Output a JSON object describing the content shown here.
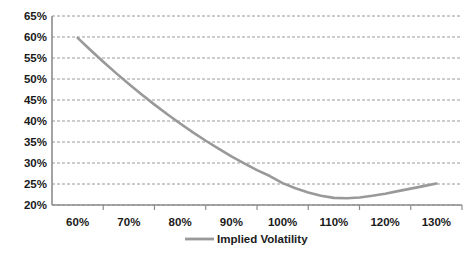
{
  "chart_data": {
    "type": "line",
    "title": "",
    "xlabel": "",
    "ylabel": "",
    "xlim": [
      55,
      135
    ],
    "ylim": [
      20,
      65
    ],
    "grid": true,
    "grid_style": "dashed-horizontal",
    "legend_position": "bottom",
    "x_tick_labels": [
      "60%",
      "70%",
      "80%",
      "90%",
      "100%",
      "110%",
      "120%",
      "130%"
    ],
    "x_tick_values": [
      60,
      70,
      80,
      90,
      100,
      110,
      120,
      130
    ],
    "y_tick_labels": [
      "20%",
      "25%",
      "30%",
      "35%",
      "40%",
      "45%",
      "50%",
      "55%",
      "60%",
      "65%"
    ],
    "y_tick_values": [
      20,
      25,
      30,
      35,
      40,
      45,
      50,
      55,
      60,
      65
    ],
    "series": [
      {
        "name": "Implied Volatility",
        "color": "#999999",
        "x": [
          60,
          62.5,
          65,
          67.5,
          70,
          72.5,
          75,
          77.5,
          80,
          82.5,
          85,
          87.5,
          90,
          92.5,
          95,
          97.5,
          100,
          102.5,
          105,
          107.5,
          110,
          112.5,
          115,
          117.5,
          120,
          122.5,
          125,
          127.5,
          130
        ],
        "values": [
          59.8,
          56.9,
          54.1,
          51.4,
          48.8,
          46.3,
          43.9,
          41.6,
          39.4,
          37.3,
          35.3,
          33.4,
          31.6,
          29.9,
          28.3,
          26.9,
          25.2,
          24.0,
          23.0,
          22.2,
          21.7,
          21.6,
          21.8,
          22.2,
          22.7,
          23.3,
          23.9,
          24.5,
          25.1
        ]
      }
    ]
  },
  "legend": {
    "entries": [
      {
        "label": "Implied Volatility",
        "color": "#999999",
        "marker": "line-swatch"
      }
    ]
  }
}
